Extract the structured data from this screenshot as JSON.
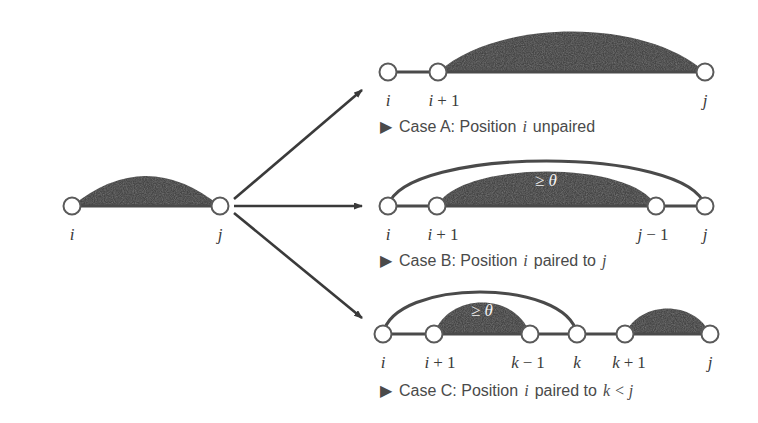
{
  "figure": {
    "background_color": "#ffffff",
    "shade_color": "#4a4a4a",
    "node_stroke_color": "#5a5a5a",
    "node_fill_color": "#ffffff",
    "backbone_color": "#4a4a4a",
    "arc_color": "#4a4a4a",
    "arrow_color": "#3a3a3a",
    "text_color": "#4a4a4a",
    "white_text_color": "#f2f2f2"
  },
  "source": {
    "name": "source-structure",
    "nodes": [
      {
        "id": "i",
        "label": "i",
        "x": 72,
        "y": 206
      },
      {
        "id": "j",
        "label": "j",
        "x": 220,
        "y": 206
      }
    ],
    "labels": [
      {
        "text": "i",
        "x": 72,
        "y": 237
      },
      {
        "text": "j",
        "x": 220,
        "y": 237
      }
    ],
    "shaded_region": {
      "from": "i",
      "to": "j",
      "height": 46
    }
  },
  "arrows": [
    {
      "name": "arrow-to-case-a",
      "from_x": 232,
      "from_y": 199,
      "to_x": 364,
      "to_y": 90
    },
    {
      "name": "arrow-to-case-b",
      "from_x": 232,
      "from_y": 206,
      "to_x": 364,
      "to_y": 206
    },
    {
      "name": "arrow-to-case-c",
      "from_x": 232,
      "from_y": 213,
      "to_x": 364,
      "to_y": 318
    }
  ],
  "cases": [
    {
      "id": "case-a",
      "caption_bullet": "▶",
      "caption_prefix": "Case A: Position",
      "caption_var": "i",
      "caption_suffix": "unpaired",
      "caption_tail_var": "",
      "baseline_y": 72,
      "label_y": 103,
      "caption_y": 128,
      "nodes": [
        {
          "id": "i",
          "x": 388
        },
        {
          "id": "i1",
          "x": 438
        },
        {
          "id": "j",
          "x": 705
        }
      ],
      "labels": [
        {
          "text": "i",
          "x": 388,
          "parts": [
            "i"
          ]
        },
        {
          "text": "i + 1",
          "x": 444,
          "parts": [
            "i",
            "+",
            "1"
          ]
        },
        {
          "text": "j",
          "x": 705,
          "parts": [
            "j"
          ]
        }
      ],
      "shaded_region": {
        "from_x": 438,
        "to_x": 705,
        "height": 44
      },
      "outer_arc": null,
      "theta_label": null
    },
    {
      "id": "case-b",
      "caption_bullet": "▶",
      "caption_prefix": "Case B: Position",
      "caption_var": "i",
      "caption_suffix": "paired to",
      "caption_tail_var": "j",
      "baseline_y": 206,
      "label_y": 237,
      "caption_y": 262,
      "nodes": [
        {
          "id": "i",
          "x": 388
        },
        {
          "id": "i1",
          "x": 437
        },
        {
          "id": "j1",
          "x": 656
        },
        {
          "id": "j",
          "x": 705
        }
      ],
      "labels": [
        {
          "text": "i",
          "x": 388,
          "parts": [
            "i"
          ]
        },
        {
          "text": "i + 1",
          "x": 443,
          "parts": [
            "i",
            "+",
            "1"
          ]
        },
        {
          "text": "j - 1",
          "x": 653,
          "parts": [
            "j",
            "−",
            "1"
          ]
        },
        {
          "text": "j",
          "x": 705,
          "parts": [
            "j"
          ]
        }
      ],
      "shaded_region": {
        "from_x": 437,
        "to_x": 656,
        "height": 42
      },
      "outer_arc": {
        "from_x": 388,
        "to_x": 705,
        "height": 62
      },
      "theta_label": {
        "text": "≥ θ",
        "x": 546,
        "y": 182
      }
    },
    {
      "id": "case-c",
      "caption_bullet": "▶",
      "caption_prefix": "Case C: Position",
      "caption_var": "i",
      "caption_suffix": "paired to",
      "caption_tail_var": "k < j",
      "baseline_y": 334,
      "label_y": 365,
      "caption_y": 392,
      "nodes": [
        {
          "id": "i",
          "x": 383
        },
        {
          "id": "i1",
          "x": 434
        },
        {
          "id": "k1",
          "x": 530
        },
        {
          "id": "k",
          "x": 577
        },
        {
          "id": "k+1",
          "x": 625
        },
        {
          "id": "j",
          "x": 710
        }
      ],
      "labels": [
        {
          "text": "i",
          "x": 383,
          "parts": [
            "i"
          ]
        },
        {
          "text": "i + 1",
          "x": 440,
          "parts": [
            "i",
            "+",
            "1"
          ]
        },
        {
          "text": "k - 1",
          "x": 528,
          "parts": [
            "k",
            "−",
            "1"
          ]
        },
        {
          "text": "k",
          "x": 577,
          "parts": [
            "k"
          ]
        },
        {
          "text": "k + 1",
          "x": 629,
          "parts": [
            "k",
            "+",
            "1"
          ]
        },
        {
          "text": "j",
          "x": 710,
          "parts": [
            "j"
          ]
        }
      ],
      "shaded_region": {
        "from_x": 434,
        "to_x": 530,
        "height": 38
      },
      "shaded_region_2": {
        "from_x": 625,
        "to_x": 710,
        "height": 30
      },
      "outer_arc": {
        "from_x": 383,
        "to_x": 577,
        "height": 56
      },
      "theta_label": {
        "text": "≥ θ",
        "x": 482,
        "y": 312
      }
    }
  ]
}
